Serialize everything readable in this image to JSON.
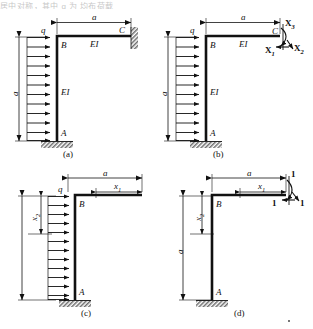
{
  "figure": {
    "top_partial_text": "居中对称，其中 q 为 均布荷载",
    "panels": [
      {
        "id": "a",
        "caption": "(a)",
        "labels": {
          "load": "q",
          "joint_top": "B",
          "joint_right": "C",
          "joint_base": "A",
          "stiffness_horizontal": "EI",
          "stiffness_vertical": "EI",
          "dim_horizontal": "a",
          "dim_vertical": "a"
        }
      },
      {
        "id": "b",
        "caption": "(b)",
        "labels": {
          "load": "q",
          "joint_top": "B",
          "joint_right": "C",
          "joint_base": "A",
          "stiffness_horizontal": "EI",
          "stiffness_vertical": "EI",
          "dim_horizontal": "a",
          "dim_vertical": "a",
          "redundant_1": "X",
          "redundant_1_sub": "1",
          "redundant_2": "X",
          "redundant_2_sub": "2",
          "redundant_3": "X",
          "redundant_3_sub": "3"
        }
      },
      {
        "id": "c",
        "caption": "(c)",
        "labels": {
          "load": "q",
          "joint_top": "B",
          "joint_base": "A",
          "dim_horizontal": "a",
          "dim_x1": "x",
          "dim_x1_sub": "1",
          "dim_x2": "x",
          "dim_x2_sub": "2"
        }
      },
      {
        "id": "d",
        "caption": "(d)",
        "labels": {
          "joint_top": "B",
          "joint_base": "A",
          "dim_horizontal": "a",
          "dim_vertical": "a",
          "dim_x1": "x",
          "dim_x1_sub": "1",
          "dim_x2": "x",
          "dim_x2_sub": "2",
          "unit_load_top": "1",
          "unit_load_left": "1",
          "unit_load_right": "1"
        }
      }
    ],
    "colors": {
      "ink": "#111111",
      "hatch": "#555555",
      "thin": "#222222"
    }
  }
}
